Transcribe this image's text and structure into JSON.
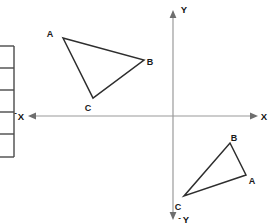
{
  "figure": {
    "background_color": "#ffffff",
    "axes": {
      "origin": {
        "x": 173,
        "y": 116
      },
      "axis_color": "#9a9a9a",
      "arrow_color": "#6e6e6e",
      "labels": {
        "x_positive": "X",
        "x_negative_sign": "-",
        "x_negative": "X",
        "y_positive": "Y",
        "y_negative_sign": "-",
        "y_negative": "Y"
      },
      "x_axis": {
        "x1": 30,
        "y1": 116,
        "x2": 258,
        "y2": 116
      },
      "y_axis": {
        "x1": 173,
        "y1": 12,
        "x2": 173,
        "y2": 218
      }
    },
    "triangles": [
      {
        "id": "triangle-upper-left",
        "quadrant": "II",
        "stroke_color": "#2e2e2e",
        "points": "63,38 144,60 93,98",
        "vertices": [
          {
            "label": "A",
            "x": 63,
            "y": 38,
            "label_x": 50,
            "label_y": 37
          },
          {
            "label": "B",
            "x": 144,
            "y": 60,
            "label_x": 149,
            "label_y": 65
          },
          {
            "label": "C",
            "x": 93,
            "y": 98,
            "label_x": 87,
            "label_y": 111
          }
        ]
      },
      {
        "id": "triangle-lower-right",
        "quadrant": "IV",
        "stroke_color": "#2e2e2e",
        "points": "246,175 230,143 184,196",
        "vertices": [
          {
            "label": "B",
            "x": 230,
            "y": 143,
            "label_x": 233,
            "label_y": 140
          },
          {
            "label": "A",
            "x": 246,
            "y": 175,
            "label_x": 250,
            "label_y": 183
          },
          {
            "label": "C",
            "x": 184,
            "y": 196,
            "label_x": 177,
            "label_y": 209
          }
        ]
      }
    ],
    "side_table": {
      "description": "partially visible table cropped at left edge",
      "stroke_color": "#4a4a4a",
      "x_right_border": 14,
      "y_top": 46,
      "y_bottom": 157,
      "row_dividers": [
        46,
        68,
        90,
        112,
        134,
        157
      ]
    }
  }
}
